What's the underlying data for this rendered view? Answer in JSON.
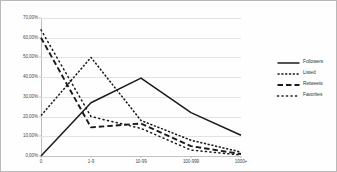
{
  "chart_data": {
    "type": "line",
    "title": "",
    "xlabel": "",
    "ylabel": "",
    "categories": [
      "0",
      "1-9",
      "10-99",
      "100-999",
      "1000+"
    ],
    "ylim": [
      0,
      70
    ],
    "ytick_values": [
      0,
      10,
      20,
      30,
      40,
      50,
      60,
      70
    ],
    "ytick_labels": [
      "0,00%",
      "10,00%",
      "20,00%",
      "30,00%",
      "40,00%",
      "50,00%",
      "60,00%",
      "70,00%"
    ],
    "grid": true,
    "legend_position": "right",
    "series": [
      {
        "name": "Followers",
        "style": "solid",
        "color": "#1a1a1a",
        "values": [
          0.0,
          27.0,
          39.5,
          22.0,
          10.5
        ]
      },
      {
        "name": "Listed",
        "style": "dotted",
        "color": "#1a1a1a",
        "values": [
          20.5,
          50.0,
          18.0,
          8.0,
          2.0
        ]
      },
      {
        "name": "Retweets",
        "style": "dashed",
        "color": "#1a1a1a",
        "values": [
          60.0,
          14.5,
          16.5,
          5.0,
          1.0
        ]
      },
      {
        "name": "Favorites",
        "style": "sparse-dotted",
        "color": "#1a1a1a",
        "values": [
          64.0,
          20.0,
          14.0,
          3.0,
          0.5
        ]
      }
    ]
  },
  "legend": {
    "items": [
      {
        "label": "Followers"
      },
      {
        "label": "Listed"
      },
      {
        "label": "Retweets"
      },
      {
        "label": "Favorites"
      }
    ]
  }
}
